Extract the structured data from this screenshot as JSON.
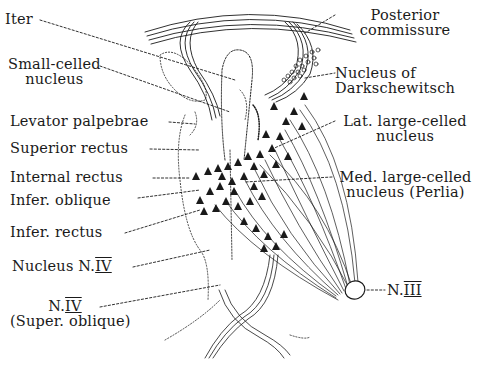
{
  "figure": {
    "colors": {
      "ink": "#1a1a1a",
      "background": "#ffffff"
    }
  },
  "labels_left": [
    {
      "id": "iter",
      "lines": [
        "Iter"
      ]
    },
    {
      "id": "small-celled",
      "lines": [
        "Small-celled",
        "nucleus"
      ]
    },
    {
      "id": "levator",
      "lines": [
        "Levator palpebrae"
      ]
    },
    {
      "id": "superior-rectus",
      "lines": [
        "Superior rectus"
      ]
    },
    {
      "id": "internal-rectus",
      "lines": [
        "Internal rectus"
      ]
    },
    {
      "id": "infer-oblique",
      "lines": [
        "Infer. oblique"
      ]
    },
    {
      "id": "infer-rectus",
      "lines": [
        "Infer. rectus"
      ]
    },
    {
      "id": "nucleus-n4",
      "lines": [
        "Nucleus N.",
        "IV"
      ]
    },
    {
      "id": "n4",
      "lines": [
        "N.",
        "IV",
        "(Super. oblique)"
      ]
    }
  ],
  "labels_right": [
    {
      "id": "posterior-commissure",
      "lines": [
        "Posterior",
        "commissure"
      ]
    },
    {
      "id": "darkschewitsch",
      "lines": [
        "Nucleus of",
        "Darkschewitsch"
      ]
    },
    {
      "id": "lat-large",
      "lines": [
        "Lat. large-celled",
        "nucleus"
      ]
    },
    {
      "id": "med-large",
      "lines": [
        "Med. large-celled",
        "nucleus (Perlia)"
      ]
    },
    {
      "id": "n3",
      "lines": [
        "N.",
        "III"
      ]
    }
  ]
}
